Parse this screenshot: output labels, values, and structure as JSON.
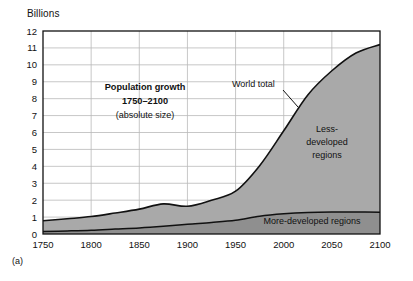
{
  "figure": {
    "panel_caption": "(a)",
    "y_unit_label": "Billions"
  },
  "chart_data": {
    "type": "area",
    "stacked": true,
    "title": "Population growth",
    "title_line2": "1750–2100",
    "subtitle": "(absolute size)",
    "xlabel": "",
    "ylabel": "Billions",
    "xlim": [
      1750,
      2100
    ],
    "ylim": [
      0,
      12
    ],
    "grid": true,
    "x_ticks": [
      1750,
      1800,
      1850,
      1900,
      1950,
      2000,
      2050,
      2100
    ],
    "x_tick_labels": [
      "1750",
      "1800",
      "1850",
      "1900",
      "1950",
      "2000",
      "2050",
      "2100"
    ],
    "y_ticks": [
      0,
      1,
      2,
      3,
      4,
      5,
      6,
      7,
      8,
      9,
      10,
      11,
      12
    ],
    "y_tick_labels": [
      "0",
      "1",
      "2",
      "3",
      "4",
      "5",
      "6",
      "7",
      "8",
      "9",
      "10",
      "11",
      "12"
    ],
    "x": [
      1750,
      1775,
      1800,
      1825,
      1850,
      1875,
      1900,
      1925,
      1950,
      1975,
      2000,
      2025,
      2050,
      2075,
      2100
    ],
    "series": [
      {
        "name": "More-developed regions",
        "label": "More-developed regions",
        "color": "#8f8f8f",
        "values": [
          0.15,
          0.18,
          0.22,
          0.29,
          0.36,
          0.46,
          0.58,
          0.68,
          0.81,
          1.05,
          1.19,
          1.27,
          1.3,
          1.3,
          1.28
        ]
      },
      {
        "name": "Less-developed regions",
        "label": "Less-developed regions",
        "color": "#a9a9a9",
        "values": [
          0.63,
          0.72,
          0.81,
          0.95,
          1.11,
          1.32,
          1.06,
          1.32,
          1.72,
          2.99,
          4.91,
          6.95,
          8.35,
          9.4,
          9.92
        ]
      }
    ],
    "total": {
      "name": "World total",
      "label": "World total",
      "values": [
        0.78,
        0.9,
        1.03,
        1.24,
        1.47,
        1.78,
        1.64,
        2.0,
        2.53,
        4.04,
        6.1,
        8.22,
        9.65,
        10.7,
        11.2
      ]
    },
    "annotations": [
      {
        "text": "World total",
        "x": 2002,
        "y": 8.3
      },
      {
        "text": "Less-developed regions",
        "x": 2065,
        "y": 5.6
      },
      {
        "text": "More-developed regions",
        "x": 2060,
        "y": 0.78
      }
    ],
    "legend_position": "inline-annotations",
    "colors": {
      "less_developed_fill": "#a9a9a9",
      "more_developed_fill": "#8f8f8f",
      "grid": "#b9b9b9",
      "axis": "#111111",
      "background": "#ffffff"
    }
  },
  "labels": {
    "world_total": "World total",
    "less_developed_l1": "Less-",
    "less_developed_l2": "developed",
    "less_developed_l3": "regions",
    "more_developed": "More-developed regions"
  }
}
